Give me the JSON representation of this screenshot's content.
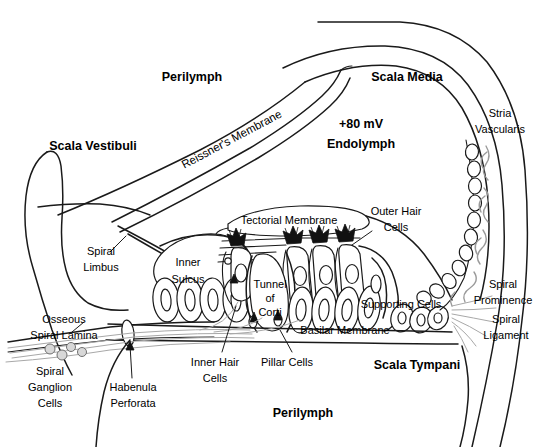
{
  "diagram": {
    "background_color": "#ffffff",
    "ink_color": "#1a1a1a",
    "fiber_color": "#a8a8a8"
  },
  "labels": {
    "perilymph_top": "Perilymph",
    "perilymph_bottom": "Perilymph",
    "scala_vestibuli": "Scala Vestibuli",
    "scala_media": "Scala Media",
    "scala_tympani": "Scala Tympani",
    "reissners_membrane": "Reissner's Membrane",
    "endolymph_voltage": "+80 mV",
    "endolymph": "Endolymph",
    "stria_vascularis_l1": "Stria",
    "stria_vascularis_l2": "Vascularis",
    "spiral_prominence_l1": "Spiral",
    "spiral_prominence_l2": "Prominence",
    "spiral_ligament_l1": "Spiral",
    "spiral_ligament_l2": "Ligament",
    "spiral_limbus_l1": "Spiral",
    "spiral_limbus_l2": "Limbus",
    "inner_sulcus_l1": "Inner",
    "inner_sulcus_l2": "Sulcus",
    "tectorial_membrane": "Tectorial Membrane",
    "outer_hair_cells_l1": "Outer Hair",
    "outer_hair_cells_l2": "Cells",
    "inner_hair_cells_l1": "Inner Hair",
    "inner_hair_cells_l2": "Cells",
    "pillar_cells": "Pillar Cells",
    "supporting_cells": "Supporting Cells",
    "basilar_membrane": "Basilar Membrane",
    "tunnel_of_corti_l1": "Tunnel",
    "tunnel_of_corti_l2": "of",
    "tunnel_of_corti_l3": "Corti",
    "osseous_spiral_lamina_l1": "Osseous",
    "osseous_spiral_lamina_l2": "Spiral Lamina",
    "spiral_ganglion_cells_l1": "Spiral",
    "spiral_ganglion_cells_l2": "Ganglion",
    "spiral_ganglion_cells_l3": "Cells",
    "habenula_perforata_l1": "Habenula",
    "habenula_perforata_l2": "Perforata"
  }
}
